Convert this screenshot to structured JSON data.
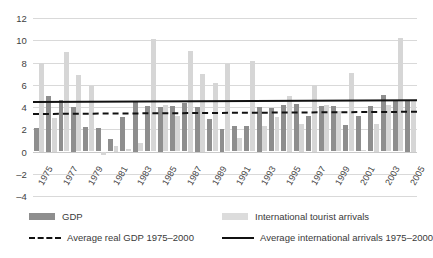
{
  "chart_data": {
    "type": "bar",
    "title": "",
    "subtitle": "",
    "xlabel": "",
    "ylabel": "",
    "ylim": [
      -4,
      12
    ],
    "yticks": [
      12,
      10,
      8,
      6,
      4,
      2,
      0,
      -2,
      -4
    ],
    "grid": true,
    "legend_position": "bottom",
    "x": [
      1975,
      1976,
      1977,
      1978,
      1979,
      1980,
      1981,
      1982,
      1983,
      1984,
      1985,
      1986,
      1987,
      1988,
      1989,
      1990,
      1991,
      1992,
      1993,
      1994,
      1995,
      1996,
      1997,
      1998,
      1999,
      2000,
      2001,
      2002,
      2003,
      2004,
      2005
    ],
    "xtick_labels": [
      "1975",
      "1977",
      "1979",
      "1981",
      "1983",
      "1985",
      "1987",
      "1989",
      "1991",
      "1993",
      "1995",
      "1997",
      "1999",
      "2001",
      "2003",
      "2005"
    ],
    "xtick_values": [
      1975,
      1977,
      1979,
      1981,
      1983,
      1985,
      1987,
      1989,
      1991,
      1993,
      1995,
      1997,
      1999,
      2001,
      2003,
      2005
    ],
    "series": [
      {
        "name": "GDP",
        "color": "#8e8e8e",
        "values": [
          2.1,
          5.0,
          4.6,
          4.0,
          2.2,
          2.1,
          1.1,
          3.1,
          4.5,
          4.1,
          4.0,
          4.1,
          4.4,
          4.0,
          2.9,
          2.0,
          2.3,
          2.3,
          4.0,
          3.9,
          4.2,
          4.3,
          3.2,
          4.1,
          4.1,
          2.4,
          3.2,
          4.1,
          5.1,
          4.6,
          4.5
        ]
      },
      {
        "name": "International tourist arrivals",
        "color": "#d6d6d6",
        "values": [
          8.0,
          3.0,
          8.9,
          6.9,
          5.9,
          -0.3,
          0.5,
          0.2,
          0.8,
          10.1,
          4.2,
          3.2,
          9.0,
          7.0,
          6.2,
          7.9,
          1.2,
          8.1,
          2.3,
          3.1,
          5.0,
          2.5,
          6.0,
          4.2,
          3.6,
          7.1,
          0.1,
          2.5,
          4.2,
          10.2,
          4.5
        ]
      }
    ],
    "reference_lines": [
      {
        "name": "Average real GDP 1975-2000",
        "style": "dashed",
        "color": "#111111",
        "y_start": 3.5,
        "y_end": 3.7
      },
      {
        "name": "Average international arrivals 1975-2000",
        "style": "solid",
        "color": "#111111",
        "y_start": 4.5,
        "y_end": 4.65
      }
    ]
  },
  "legend": {
    "items": [
      {
        "label": "GDP",
        "key": "swatch-gdp"
      },
      {
        "label": "International tourist arrivals",
        "key": "swatch-arr"
      },
      {
        "label": "Average real GDP 1975–2000",
        "key": "line-dashed"
      },
      {
        "label": "Average international arrivals 1975–2000",
        "key": "line-solid"
      }
    ]
  }
}
